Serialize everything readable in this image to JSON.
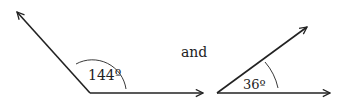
{
  "diagram": {
    "angles": [
      {
        "label": "144º",
        "vertex": [
          90,
          93
        ],
        "ray_end": [
          17,
          12
        ],
        "base_end": [
          203,
          93
        ]
      },
      {
        "label": "36º",
        "vertex": [
          217,
          93
        ],
        "ray_end": [
          308,
          26
        ],
        "base_end": [
          330,
          93
        ]
      }
    ],
    "connector_text": "and",
    "stroke_color": "#222222"
  }
}
